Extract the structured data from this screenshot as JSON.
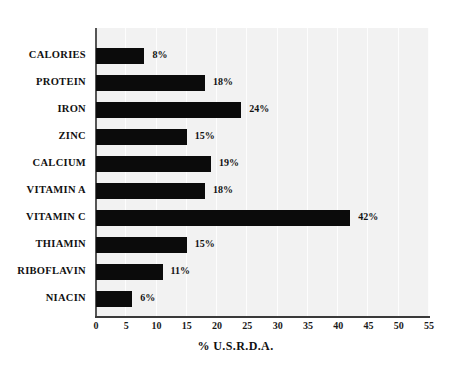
{
  "chart_data": {
    "type": "bar",
    "orientation": "horizontal",
    "title": "",
    "xlabel": "% U.S.R.D.A.",
    "ylabel": "",
    "xlim": [
      0,
      55
    ],
    "xticks": [
      0,
      5,
      10,
      15,
      20,
      25,
      30,
      35,
      40,
      45,
      50,
      55
    ],
    "grid": true,
    "grid_axis": "x",
    "legend": false,
    "bar_color": "#0b0b0b",
    "plot_background": "#f2f2f2",
    "categories": [
      "CALORIES",
      "PROTEIN",
      "IRON",
      "ZINC",
      "CALCIUM",
      "VITAMIN A",
      "VITAMIN C",
      "THIAMIN",
      "RIBOFLAVIN",
      "NIACIN"
    ],
    "values": [
      8,
      18,
      24,
      15,
      19,
      18,
      42,
      15,
      11,
      6
    ],
    "data_labels": [
      "8%",
      "18%",
      "24%",
      "15%",
      "19%",
      "18%",
      "42%",
      "15%",
      "11%",
      "6%"
    ],
    "tick_labels": [
      "0",
      "5",
      "10",
      "15",
      "20",
      "25",
      "30",
      "35",
      "40",
      "45",
      "50",
      "55"
    ]
  }
}
